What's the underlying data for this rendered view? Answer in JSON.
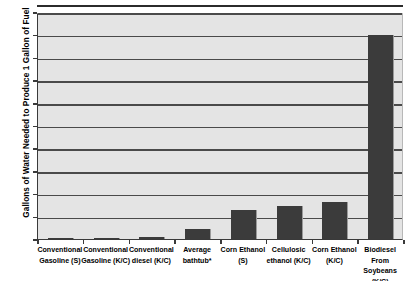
{
  "chart_data": {
    "type": "bar",
    "title": "",
    "xlabel": "",
    "ylabel": "Gallons of Water Needed to Produce 1 Gallon of  Fuel",
    "ylim": [
      0,
      1000
    ],
    "ytick_labels": [
      "1,000",
      "900",
      "800",
      "700",
      "600",
      "500",
      "400",
      "300",
      "200",
      "100",
      "0"
    ],
    "ytick_values": [
      1000,
      900,
      800,
      700,
      600,
      500,
      400,
      300,
      200,
      100,
      0
    ],
    "grid": true,
    "legend": "none",
    "bar_color": "#3b3b3b",
    "plot_background": "#e4e4e4",
    "gridline_color": "#4a4a4a",
    "categories": [
      "Conventional Gasoline (S)",
      "Conventional Gasoline (K/C)",
      "Conventional diesel (K/C)",
      "Average bathtub*",
      "Corn Ethanol (S)",
      "Cellulosic ethanol (K/C)",
      "Corn Ethanol (K/C)",
      "Biodiesel From Soybeans (K/C)"
    ],
    "category_lines": [
      [
        "Conventional",
        "Gasoline (S)"
      ],
      [
        "Conventional",
        "Gasoline (K/C)"
      ],
      [
        "Conventional",
        "diesel (K/C)"
      ],
      [
        "Average",
        "bathtub*"
      ],
      [
        "Corn Ethanol",
        "(S)"
      ],
      [
        "Cellulosic",
        "ethanol (K/C)"
      ],
      [
        "Corn Ethanol",
        "(K/C)"
      ],
      [
        "Biodiesel",
        "From",
        "Soybeans",
        "(K/C)"
      ]
    ],
    "values": [
      4,
      5,
      9,
      45,
      130,
      146,
      165,
      900
    ]
  }
}
